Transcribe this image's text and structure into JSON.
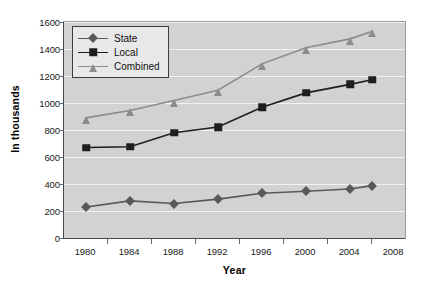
{
  "chart_data": {
    "type": "line",
    "title": "",
    "subtitle": "",
    "xlabel": "Year",
    "ylabel": "In thousands",
    "x": [
      1980,
      1984,
      1988,
      1992,
      1996,
      2000,
      2004,
      2006
    ],
    "x_tick_labels": [
      "1980",
      "1984",
      "1988",
      "1992",
      "1996",
      "2000",
      "2004",
      "2008"
    ],
    "x_tick_values": [
      1980,
      1984,
      1988,
      1992,
      1996,
      2000,
      2004,
      2008
    ],
    "xlim": [
      1978,
      2009
    ],
    "y_tick_labels": [
      "0",
      "200",
      "400",
      "600",
      "800",
      "1000",
      "1200",
      "1400",
      "1600"
    ],
    "y_tick_values": [
      0,
      200,
      400,
      600,
      800,
      1000,
      1200,
      1400,
      1600
    ],
    "ylim": [
      0,
      1600
    ],
    "grid": true,
    "grid_axis": "y",
    "legend_position": "top-left",
    "series": [
      {
        "name": "State",
        "marker": "diamond",
        "color": "#595959",
        "values": [
          230,
          275,
          255,
          288,
          332,
          346,
          363,
          388
        ]
      },
      {
        "name": "Local",
        "marker": "square",
        "color": "#1e1e1e",
        "values": [
          670,
          676,
          780,
          822,
          968,
          1075,
          1138,
          1172
        ]
      },
      {
        "name": "Combined",
        "marker": "triangle",
        "color": "#8c8c8c",
        "values": [
          890,
          945,
          1018,
          1095,
          1290,
          1410,
          1475,
          1530
        ]
      }
    ]
  },
  "colors": {
    "plot_background": "#d2d2d2",
    "page_background": "#ffffff",
    "gridline": "#f2f2f2",
    "axis": "#4a4a4a",
    "legend_background": "#e8e8e8",
    "legend_border": "#3d3d3d",
    "text": "#111111"
  },
  "legend": {
    "items": [
      {
        "label": "State"
      },
      {
        "label": "Local"
      },
      {
        "label": "Combined"
      }
    ]
  }
}
